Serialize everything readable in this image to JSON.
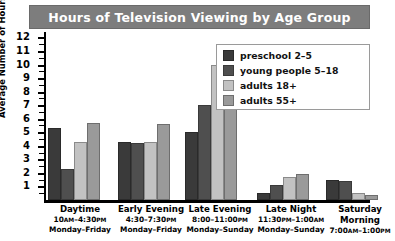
{
  "chart_data": {
    "type": "bar",
    "title": "Hours of Television Viewing by Age Group",
    "xlabel": "",
    "ylabel": "Average Number of Hours Per Week",
    "ylim": [
      0,
      12.4
    ],
    "yticks": [
      1,
      2,
      3,
      4,
      5,
      6,
      7,
      8,
      9,
      10,
      11,
      12
    ],
    "grid": false,
    "legend_position": "top-right",
    "categories": [
      "Daytime",
      "Early Evening",
      "Late Evening",
      "Late Night",
      "Saturday Morning"
    ],
    "category_detail": [
      {
        "name": "Daytime",
        "time": "10AM–4:30PM",
        "days": "Monday–Friday"
      },
      {
        "name": "Early Evening",
        "time": "4:30–7:30PM",
        "days": "Monday–Friday"
      },
      {
        "name": "Late Evening",
        "time": "8:00–11:00PM",
        "days": "Monday–Sunday"
      },
      {
        "name": "Late Night",
        "time": "11:30PM–1:00AM",
        "days": "Monday–Sunday"
      },
      {
        "name": "Saturday Morning",
        "time": "7:00AM–1:00PM",
        "days": ""
      }
    ],
    "series": [
      {
        "name": "preschool 2–5",
        "color": "#3a3a3a",
        "values": [
          5.3,
          4.3,
          5.0,
          0.5,
          1.5
        ]
      },
      {
        "name": "young people 5–18",
        "color": "#4f4f4f",
        "values": [
          2.3,
          4.2,
          7.0,
          1.1,
          1.4
        ]
      },
      {
        "name": "adults 18+",
        "color": "#c2c2c2",
        "values": [
          4.3,
          4.3,
          10.0,
          1.7,
          0.5
        ]
      },
      {
        "name": "adults 55+",
        "color": "#9a9a9a",
        "values": [
          5.7,
          5.6,
          11.3,
          1.9,
          0.4
        ]
      }
    ]
  },
  "legend": {
    "items": [
      {
        "label": "preschool 2–5"
      },
      {
        "label": "young people 5–18"
      },
      {
        "label": "adults 18+"
      },
      {
        "label": "adults 55+"
      }
    ]
  }
}
